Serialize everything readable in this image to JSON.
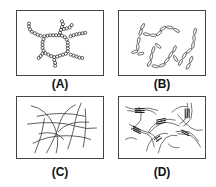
{
  "panels": [
    {
      "id": "A",
      "label": "(A)",
      "depicts": "branched network of bead chains (hexagonal ring)"
    },
    {
      "id": "B",
      "label": "(B)",
      "depicts": "chains of elongated elliptical segments"
    },
    {
      "id": "C",
      "label": "(C)",
      "depicts": "randomly crossing fibrous lines"
    },
    {
      "id": "D",
      "label": "(D)",
      "depicts": "fibers with aligned junction zones (bundled crosslinks)"
    }
  ],
  "colors": {
    "stroke": "#333333",
    "border": "#444444",
    "background": "#ffffff"
  }
}
